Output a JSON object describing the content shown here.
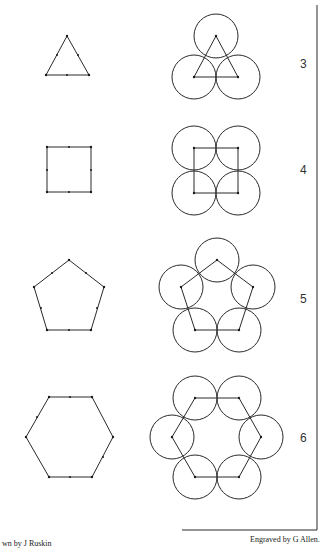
{
  "plate": {
    "figures": [
      {
        "number": "3",
        "shape": "triangle",
        "sides": 3
      },
      {
        "number": "4",
        "shape": "square",
        "sides": 4
      },
      {
        "number": "5",
        "shape": "pentagon",
        "sides": 5
      },
      {
        "number": "6",
        "shape": "hexagon",
        "sides": 6
      }
    ],
    "credits": {
      "left": "wn by J Ruskin",
      "right": "Engraved by G Allen."
    },
    "colors": {
      "ink": "#1a1a1a",
      "paper": "#ffffff"
    }
  }
}
